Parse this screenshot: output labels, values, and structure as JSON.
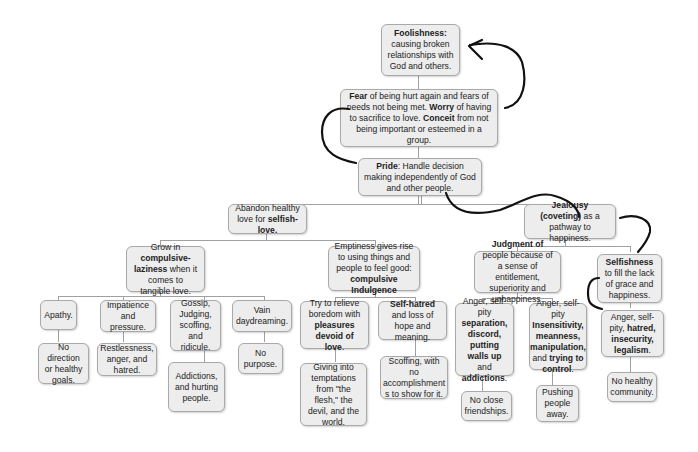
{
  "diagram": {
    "type": "hierarchical flowchart (sin / pride tree) with hand-drawn arrows",
    "root": {
      "id": "foolishness",
      "parts": [
        {
          "b": "Foolishness:"
        },
        {
          "t": " causing broken relationships with God and others."
        }
      ]
    },
    "level1": {
      "id": "fear",
      "parts": [
        {
          "b": "Fear"
        },
        {
          "t": " of being hurt again and fears of needs not being met. "
        },
        {
          "b": "Worry"
        },
        {
          "t": " of having to sacrifice to love. "
        },
        {
          "b": "Conceit"
        },
        {
          "t": " from not being important or esteemed in a group."
        }
      ]
    },
    "level2": {
      "id": "pride",
      "parts": [
        {
          "b": "Pride"
        },
        {
          "t": ": Handle decision making independently of God and other people."
        }
      ]
    },
    "nodes": [
      {
        "id": "abandon",
        "parts": [
          {
            "t": "Abandon healthy love for "
          },
          {
            "b": "selfish-love."
          }
        ]
      },
      {
        "id": "jealousy",
        "parts": [
          {
            "b": "Jealousy (coveting)"
          },
          {
            "t": " as a pathway to happiness."
          }
        ]
      },
      {
        "id": "laziness",
        "parts": [
          {
            "t": "Grow in "
          },
          {
            "b": "compulsive-laziness"
          },
          {
            "t": " when it comes to tangible love."
          }
        ]
      },
      {
        "id": "emptiness",
        "parts": [
          {
            "t": "Emptiness gives rise to using things and people to feel good: "
          },
          {
            "b": "compulsive Indulgence"
          }
        ]
      },
      {
        "id": "judgment",
        "parts": [
          {
            "b": "Judgment of"
          },
          {
            "t": " people because of a sense of entitlement, superiority and unhappiness."
          }
        ]
      },
      {
        "id": "selfishness",
        "parts": [
          {
            "b": "Selfishness"
          },
          {
            "t": " to fill the lack of grace and happiness."
          }
        ]
      },
      {
        "id": "apathy",
        "parts": [
          {
            "t": "Apathy."
          }
        ]
      },
      {
        "id": "impatience",
        "parts": [
          {
            "t": "Impatience and pressure."
          }
        ]
      },
      {
        "id": "gossip",
        "parts": [
          {
            "t": "Gossip, Judging, scoffing, and ridicule."
          }
        ]
      },
      {
        "id": "vain",
        "parts": [
          {
            "t": "Vain daydreaming."
          }
        ]
      },
      {
        "id": "relieve",
        "parts": [
          {
            "t": "Try to relieve boredom with "
          },
          {
            "b": "pleasures devoid of love"
          },
          {
            "t": "."
          }
        ]
      },
      {
        "id": "selfhatred",
        "parts": [
          {
            "b": "Self-hatred"
          },
          {
            "t": " and loss of hope and meaning."
          }
        ]
      },
      {
        "id": "anger1",
        "parts": [
          {
            "t": "Anger, self-pity "
          },
          {
            "b": "separation, discord, putting walls up"
          },
          {
            "t": " and "
          },
          {
            "b": "addictions"
          },
          {
            "t": "."
          }
        ]
      },
      {
        "id": "anger2",
        "parts": [
          {
            "t": "Anger, self-pity "
          },
          {
            "b": "Insensitivity, meanness, manipulation,"
          },
          {
            "t": " and "
          },
          {
            "b": "trying to control"
          },
          {
            "t": "."
          }
        ]
      },
      {
        "id": "anger3",
        "parts": [
          {
            "t": "Anger, self-pity, "
          },
          {
            "b": "hatred, insecurity, legalism"
          },
          {
            "t": "."
          }
        ]
      },
      {
        "id": "nodirection",
        "parts": [
          {
            "t": "No direction or healthy goals."
          }
        ]
      },
      {
        "id": "restlessness",
        "parts": [
          {
            "t": "Restlessness, anger, and hatred."
          }
        ]
      },
      {
        "id": "addictions",
        "parts": [
          {
            "t": "Addictions, and hurting people."
          }
        ]
      },
      {
        "id": "nopurpose",
        "parts": [
          {
            "t": "No purpose."
          }
        ]
      },
      {
        "id": "temptations",
        "parts": [
          {
            "t": "Giving into temptations from \"the flesh,\" the devil, and the world."
          }
        ]
      },
      {
        "id": "scoffing",
        "parts": [
          {
            "t": "Scoffing, with no accomplishment s to show for it."
          }
        ]
      },
      {
        "id": "closefriends",
        "parts": [
          {
            "t": "No close friendships."
          }
        ]
      },
      {
        "id": "pushing",
        "parts": [
          {
            "t": "Pushing people away."
          }
        ]
      },
      {
        "id": "community",
        "parts": [
          {
            "t": "No healthy community."
          }
        ]
      }
    ],
    "colors": {
      "box_fill": "#ededed",
      "box_border": "#a9a9a9",
      "connector": "#a0a0a0",
      "ink": "#111111"
    }
  }
}
